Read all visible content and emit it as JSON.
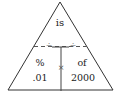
{
  "diagram": {
    "type": "percent-triangle",
    "top": {
      "label": "is"
    },
    "bottom_left": {
      "label": "%",
      "value": ".01"
    },
    "bottom_right": {
      "label": "of",
      "value": "2000"
    },
    "operators": {
      "divide_left": "÷",
      "divide_right": "÷",
      "multiply": "×"
    },
    "colors": {
      "line": "#333333",
      "text": "#222222"
    }
  }
}
